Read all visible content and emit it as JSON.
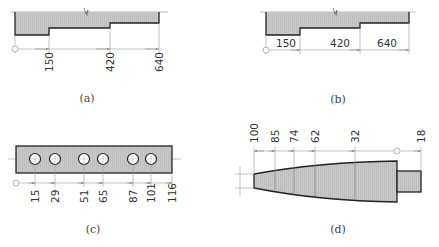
{
  "colors": {
    "fill": "#c8c8c8",
    "outline": "#222222",
    "dim_line": "#9a9a9a",
    "text": "#333333",
    "background": "#ffffff"
  },
  "panels": [
    {
      "id": "a",
      "caption": "(a)",
      "style": "stepped shaft, ordinate dimensions measured from origin, labels rotated vertical",
      "dimensions": [
        "150",
        "420",
        "640"
      ]
    },
    {
      "id": "b",
      "caption": "(b)",
      "style": "stepped shaft, ordinate dimensions measured from origin, labels horizontal inline",
      "dimensions": [
        "150",
        "420",
        "640"
      ]
    },
    {
      "id": "c",
      "caption": "(c)",
      "style": "rectangular plate with six holes, ordinate dimensions to hole centers",
      "dimensions": [
        "15",
        "29",
        "51",
        "65",
        "87",
        "101",
        "116"
      ]
    },
    {
      "id": "d",
      "caption": "(d)",
      "style": "tapered shaft, diameters dimensioned with ordinate labels above",
      "dimensions": [
        "100",
        "85",
        "74",
        "62",
        "32",
        "18"
      ]
    }
  ]
}
